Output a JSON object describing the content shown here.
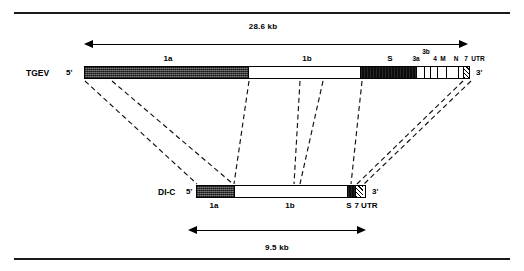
{
  "figure": {
    "type": "genome-organization-diagram",
    "top_rule": "",
    "bottom_rule": ""
  },
  "scales": {
    "genome": {
      "label": "28.6 kb"
    },
    "di": {
      "label": "9.5 kb"
    }
  },
  "constructs": [
    {
      "id": "tgev",
      "name": "TGEV",
      "five_prime": "5'",
      "three_prime": "3'",
      "segments": [
        {
          "key": "1a",
          "label": "1a",
          "fill": "stipple",
          "divider": true
        },
        {
          "key": "1b",
          "label": "1b",
          "fill": "white",
          "divider": true
        },
        {
          "key": "S",
          "label": "S",
          "fill": "black",
          "divider": true
        },
        {
          "key": "3a",
          "label": "3a",
          "fill": "white",
          "divider": true
        },
        {
          "key": "3b",
          "label": "3b",
          "fill": "white",
          "divider": true
        },
        {
          "key": "4",
          "label": "4",
          "fill": "white",
          "divider": true
        },
        {
          "key": "M",
          "label": "M",
          "fill": "white",
          "divider": true
        },
        {
          "key": "N",
          "label": "N",
          "fill": "white",
          "divider": true
        },
        {
          "key": "7",
          "label": "7",
          "fill": "white",
          "divider": true
        },
        {
          "key": "UTR",
          "label": "UTR",
          "fill": "hatch",
          "divider": true
        }
      ],
      "above_labels": [
        "1a",
        "1b",
        "S",
        "3a",
        "3b",
        "4",
        "M",
        "N",
        "7",
        "UTR"
      ]
    },
    {
      "id": "di-c",
      "name": "DI-C",
      "five_prime": "5'",
      "three_prime": "3'",
      "segments": [
        {
          "key": "1a",
          "label": "1a",
          "fill": "stipple",
          "divider": true
        },
        {
          "key": "1b",
          "label": "1b",
          "fill": "white",
          "divider": true
        },
        {
          "key": "S",
          "label": "S",
          "fill": "black",
          "divider": true
        },
        {
          "key": "UTR",
          "label": "7 UTR",
          "fill": "hatch",
          "divider": true
        }
      ],
      "below_labels": [
        "1a",
        "1b",
        "S",
        "7 UTR"
      ]
    }
  ],
  "labels": {
    "tgev_name": "TGEV",
    "tgev_five": "5'",
    "tgev_three": "3'",
    "dic_name": "DI-C",
    "dic_five": "5'",
    "dic_three": "3'",
    "tgev_1a": "1a",
    "tgev_1b": "1b",
    "tgev_S": "S",
    "tgev_3a": "3a",
    "tgev_3b": "3b",
    "tgev_4": "4",
    "tgev_M": "M",
    "tgev_N": "N",
    "tgev_7": "7",
    "tgev_UTR": "UTR",
    "dic_1a": "1a",
    "dic_1b": "1b",
    "dic_S": "S",
    "dic_7UTR": "7 UTR",
    "kb_genome": "28.6 kb",
    "kb_di": "9.5 kb"
  },
  "colors": {
    "ink": "#000000",
    "paper": "#ffffff",
    "stipple_gray": "#5b5b5b",
    "solid_black": "#0d0d0d"
  }
}
